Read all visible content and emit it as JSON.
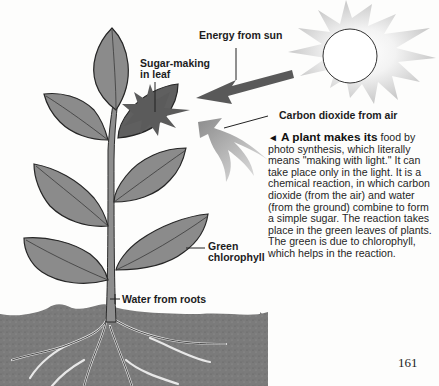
{
  "labels": {
    "energy": "Energy from sun",
    "sugar_line1": "Sugar-making",
    "sugar_line2": "in leaf",
    "co2": "Carbon dioxide from air",
    "green_line1": "Green",
    "green_line2": "chlorophyll",
    "water": "Water from roots"
  },
  "caption": {
    "marker": "◄",
    "lead": "A plant makes its",
    "body": "food by photo synthesis, which literally means \"making with light.\" It can take place only in the light. It is a chemical reaction, in which carbon dioxide (from the air) and water (from the ground) combine to form a simple sugar. The reaction takes place in the green leaves of plants. The green is due to chlorophyll, which helps in the reaction."
  },
  "page_number": "161",
  "colors": {
    "leaf": "#8a8a8a",
    "leaf_outline": "#2a2a2a",
    "soil": "#7a7a7a",
    "arrow_dark": "#555555",
    "arrow_light": "#9a9a9a",
    "sun_rays": "#cfcfcf"
  }
}
